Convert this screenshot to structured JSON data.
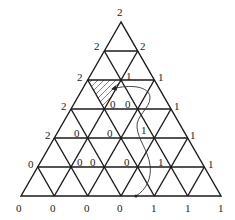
{
  "diagram": {
    "type": "triangulated-simplex-labeling",
    "subdivisions": 6,
    "geometry": {
      "apex": [
        121,
        22
      ],
      "base_left": [
        21,
        196
      ],
      "base_right": [
        221,
        196
      ]
    },
    "labels": {
      "apex": "2",
      "row1": {
        "left": "2",
        "right": "2"
      },
      "row2": {
        "left": "2",
        "interior": [
          "1"
        ],
        "right": "1"
      },
      "row3": {
        "left": "2",
        "interior": [
          "0",
          "0"
        ],
        "right": "1"
      },
      "row4": {
        "left": "2",
        "interior": [
          "0",
          "0",
          "1"
        ],
        "right": "1"
      },
      "row5": {
        "left": "0",
        "interior": [
          "0",
          "0",
          "0",
          "1"
        ],
        "right": "1"
      },
      "base": [
        "0",
        "0",
        "0",
        "0",
        "1",
        "1",
        "1"
      ]
    },
    "shaded_cell": "hatched triangle between row 2 and row 3 near left edge (fully-labeled start cell)",
    "path": "curved arrow path from base dot up through cells to the hatched cell"
  }
}
